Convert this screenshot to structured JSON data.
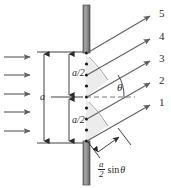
{
  "figure": {
    "colors": {
      "line": "#5a5a5a",
      "dark_line": "#2b2b2b",
      "barrier_fill": "#8c8c8c",
      "barrier_edge": "#4a4a4a",
      "wedge_fill": "#e8e8e8",
      "dot": "#1a1a1a",
      "dashed": "#7a7a7a"
    }
  },
  "incoming_waves": {
    "name": "incident-plane-wave-arrows",
    "count": 5,
    "direction": "rightward"
  },
  "barrier": {
    "name": "slit-barrier",
    "segments": [
      "top",
      "bottom"
    ],
    "orientation": "vertical"
  },
  "slit": {
    "name": "slit-aperture",
    "source_points": 9
  },
  "dimensions": [
    {
      "label": "a/2",
      "id": "upper-half-width"
    },
    {
      "label": "a",
      "id": "full-slit-width"
    },
    {
      "label": "a/2",
      "id": "lower-half-width"
    }
  ],
  "rays": [
    {
      "label": "5",
      "id": "ray-5"
    },
    {
      "label": "4",
      "id": "ray-4"
    },
    {
      "label": "3",
      "id": "ray-3"
    },
    {
      "label": "2",
      "id": "ray-2"
    },
    {
      "label": "1",
      "id": "ray-1"
    }
  ],
  "angle": {
    "label": "θ",
    "id": "diffraction-angle",
    "measured_from": "central-axis"
  },
  "path_difference": {
    "id": "path-difference-label",
    "numerator": "a",
    "denominator": "2",
    "trig": "sin",
    "variable": "θ",
    "full_text": "(a/2) sin θ"
  },
  "center_axis": {
    "id": "central-axis",
    "style": "dashed"
  }
}
